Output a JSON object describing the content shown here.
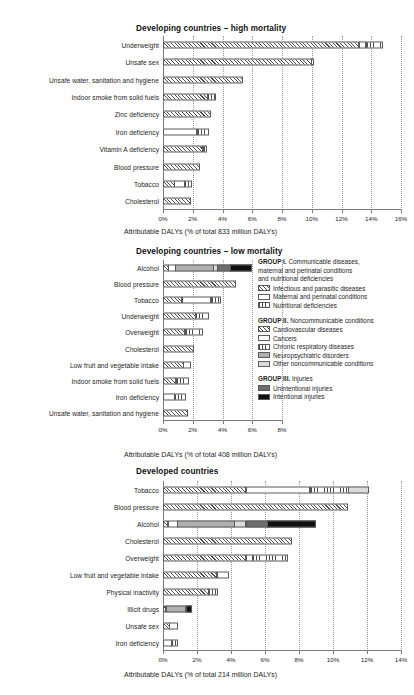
{
  "chart_data": [
    {
      "type": "bar",
      "orientation": "horizontal",
      "stacked": true,
      "title": "Developing countries – high mortality",
      "xlabel": "Attributable DALYs (% of total 833 million DALYs)",
      "ylabel": "",
      "xlim": [
        0,
        16
      ],
      "xticks": [
        "0%",
        "2%",
        "4%",
        "6%",
        "8%",
        "10%",
        "12%",
        "14%",
        "16%"
      ],
      "xtick_values": [
        0,
        2,
        4,
        6,
        8,
        10,
        12,
        14,
        16
      ],
      "grid": "vertical-dotted",
      "categories": [
        "Underweight",
        "Unsafe sex",
        "Unsafe water, sanitation and hygiene",
        "Indoor smoke from solid fuels",
        "Zinc deficiency",
        "Iron deficiency",
        "Vitamin A deficiency",
        "Blood pressure",
        "Tobacco",
        "Cholesterol"
      ],
      "segment_names": [
        "Infectious and parasitic diseases",
        "Maternal and perinatal conditions",
        "Nutritional deficiencies",
        "Cardiovascular diseases",
        "Cancers",
        "Chronic respiratory diseases",
        "Neuropsychiatric disorders",
        "Other noncommunicable conditions",
        "Unintentional injuries",
        "Intentional injuries"
      ],
      "bars": [
        {
          "category": "Underweight",
          "total": 14.9,
          "segments": [
            {
              "fill": "infectious-and-parasitic-diseases",
              "value": 13.2
            },
            {
              "fill": "maternal-and-perinatal-conditions",
              "value": 0.5
            },
            {
              "fill": "nutritional-deficiencies",
              "value": 1.2
            }
          ]
        },
        {
          "category": "Unsafe sex",
          "total": 10.2,
          "segments": [
            {
              "fill": "infectious-and-parasitic-diseases",
              "value": 10.0
            },
            {
              "fill": "cancers",
              "value": 0.2
            }
          ]
        },
        {
          "category": "Unsafe water, sanitation and hygiene",
          "total": 5.4,
          "segments": [
            {
              "fill": "infectious-and-parasitic-diseases",
              "value": 5.4
            }
          ]
        },
        {
          "category": "Indoor smoke from solid fuels",
          "total": 3.6,
          "segments": [
            {
              "fill": "infectious-and-parasitic-diseases",
              "value": 3.0
            },
            {
              "fill": "chronic-respiratory-diseases",
              "value": 0.6
            }
          ]
        },
        {
          "category": "Zinc deficiency",
          "total": 3.2,
          "segments": [
            {
              "fill": "infectious-and-parasitic-diseases",
              "value": 3.2
            }
          ]
        },
        {
          "category": "Iron deficiency",
          "total": 3.1,
          "segments": [
            {
              "fill": "maternal-and-perinatal-conditions",
              "value": 2.3
            },
            {
              "fill": "nutritional-deficiencies",
              "value": 0.8
            }
          ]
        },
        {
          "category": "Vitamin A deficiency",
          "total": 3.0,
          "segments": [
            {
              "fill": "infectious-and-parasitic-diseases",
              "value": 2.7
            },
            {
              "fill": "nutritional-deficiencies",
              "value": 0.3
            }
          ]
        },
        {
          "category": "Blood pressure",
          "total": 2.5,
          "segments": [
            {
              "fill": "cardiovascular-diseases",
              "value": 2.5
            }
          ]
        },
        {
          "category": "Tobacco",
          "total": 2.0,
          "segments": [
            {
              "fill": "cardiovascular-diseases",
              "value": 0.8
            },
            {
              "fill": "cancers",
              "value": 0.7
            },
            {
              "fill": "chronic-respiratory-diseases",
              "value": 0.5
            }
          ]
        },
        {
          "category": "Cholesterol",
          "total": 1.9,
          "segments": [
            {
              "fill": "cardiovascular-diseases",
              "value": 1.9
            }
          ]
        }
      ]
    },
    {
      "type": "bar",
      "orientation": "horizontal",
      "stacked": true,
      "title": "Developing countries – low mortality",
      "xlabel": "Attributable DALYs (% of total 408 million DALYs)",
      "ylabel": "",
      "xlim": [
        0,
        8
      ],
      "xticks": [
        "0%",
        "2%",
        "4%",
        "6%",
        "8%"
      ],
      "xtick_values": [
        0,
        2,
        4,
        6,
        8
      ],
      "grid": "vertical-dotted",
      "categories": [
        "Alcohol",
        "Blood pressure",
        "Tobacco",
        "Underweight",
        "Overweight",
        "Cholesterol",
        "Low fruit and vegetable intake",
        "Indoor smoke from solid fuels",
        "Iron deficiency",
        "Unsafe water, sanitation and hygiene"
      ],
      "bars": [
        {
          "category": "Alcohol",
          "total": 6.2,
          "segments": [
            {
              "fill": "infectious-and-parasitic-diseases",
              "value": 0.4
            },
            {
              "fill": "cancers",
              "value": 0.5
            },
            {
              "fill": "neuropsychiatric-disorders",
              "value": 2.6
            },
            {
              "fill": "other-noncommunicable-conditions",
              "value": 0.3
            },
            {
              "fill": "unintentional-injuries",
              "value": 0.9
            },
            {
              "fill": "intentional-injuries",
              "value": 1.5
            }
          ]
        },
        {
          "category": "Blood pressure",
          "total": 4.9,
          "segments": [
            {
              "fill": "cardiovascular-diseases",
              "value": 4.9
            }
          ]
        },
        {
          "category": "Tobacco",
          "total": 4.0,
          "segments": [
            {
              "fill": "cardiovascular-diseases",
              "value": 1.3
            },
            {
              "fill": "cancers",
              "value": 2.0
            },
            {
              "fill": "chronic-respiratory-diseases",
              "value": 0.7
            }
          ]
        },
        {
          "category": "Underweight",
          "total": 3.1,
          "segments": [
            {
              "fill": "infectious-and-parasitic-diseases",
              "value": 2.2
            },
            {
              "fill": "nutritional-deficiencies",
              "value": 0.9
            }
          ]
        },
        {
          "category": "Overweight",
          "total": 2.7,
          "segments": [
            {
              "fill": "cardiovascular-diseases",
              "value": 1.5
            },
            {
              "fill": "chronic-respiratory-diseases",
              "value": 1.2
            }
          ]
        },
        {
          "category": "Cholesterol",
          "total": 2.1,
          "segments": [
            {
              "fill": "cardiovascular-diseases",
              "value": 2.1
            }
          ]
        },
        {
          "category": "Low fruit and vegetable intake",
          "total": 1.9,
          "segments": [
            {
              "fill": "cardiovascular-diseases",
              "value": 1.4
            },
            {
              "fill": "cancers",
              "value": 0.5
            }
          ]
        },
        {
          "category": "Indoor smoke from solid fuels",
          "total": 1.8,
          "segments": [
            {
              "fill": "infectious-and-parasitic-diseases",
              "value": 0.9
            },
            {
              "fill": "chronic-respiratory-diseases",
              "value": 0.9
            }
          ]
        },
        {
          "category": "Iron deficiency",
          "total": 1.6,
          "segments": [
            {
              "fill": "maternal-and-perinatal-conditions",
              "value": 0.8
            },
            {
              "fill": "nutritional-deficiencies",
              "value": 0.8
            }
          ]
        },
        {
          "category": "Unsafe water, sanitation and hygiene",
          "total": 1.7,
          "segments": [
            {
              "fill": "infectious-and-parasitic-diseases",
              "value": 1.7
            }
          ]
        }
      ]
    },
    {
      "type": "bar",
      "orientation": "horizontal",
      "stacked": true,
      "title": "Developed countries",
      "xlabel": "Attributable DALYs (% of total 214 million DALYs)",
      "ylabel": "",
      "xlim": [
        0,
        14
      ],
      "xticks": [
        "0%",
        "2%",
        "4%",
        "6%",
        "8%",
        "10%",
        "12%",
        "14%"
      ],
      "xtick_values": [
        0,
        2,
        4,
        6,
        8,
        10,
        12,
        14
      ],
      "grid": "vertical-dotted",
      "categories": [
        "Tobacco",
        "Blood pressure",
        "Alcohol",
        "Cholesterol",
        "Overweight",
        "Low fruit and vegetable intake",
        "Physical inactivity",
        "Illicit drugs",
        "Unsafe sex",
        "Iron deficiency"
      ],
      "bars": [
        {
          "category": "Tobacco",
          "total": 12.2,
          "segments": [
            {
              "fill": "cardiovascular-diseases",
              "value": 4.9
            },
            {
              "fill": "cancers",
              "value": 3.8
            },
            {
              "fill": "chronic-respiratory-diseases",
              "value": 2.3
            },
            {
              "fill": "other-noncommunicable-conditions",
              "value": 1.2
            }
          ]
        },
        {
          "category": "Blood pressure",
          "total": 10.9,
          "segments": [
            {
              "fill": "cardiovascular-diseases",
              "value": 10.9
            }
          ]
        },
        {
          "category": "Alcohol",
          "total": 9.2,
          "segments": [
            {
              "fill": "cardiovascular-diseases",
              "value": 0.3
            },
            {
              "fill": "cancers",
              "value": 0.6
            },
            {
              "fill": "neuropsychiatric-disorders",
              "value": 3.4
            },
            {
              "fill": "other-noncommunicable-conditions",
              "value": 0.7
            },
            {
              "fill": "unintentional-injuries",
              "value": 1.3
            },
            {
              "fill": "intentional-injuries",
              "value": 2.9
            }
          ]
        },
        {
          "category": "Cholesterol",
          "total": 7.6,
          "segments": [
            {
              "fill": "cardiovascular-diseases",
              "value": 7.6
            }
          ]
        },
        {
          "category": "Overweight",
          "total": 7.4,
          "segments": [
            {
              "fill": "cardiovascular-diseases",
              "value": 4.9
            },
            {
              "fill": "cancers",
              "value": 0.4
            },
            {
              "fill": "chronic-respiratory-diseases",
              "value": 2.1
            }
          ]
        },
        {
          "category": "Low fruit and vegetable intake",
          "total": 3.9,
          "segments": [
            {
              "fill": "cardiovascular-diseases",
              "value": 3.2
            },
            {
              "fill": "cancers",
              "value": 0.7
            }
          ]
        },
        {
          "category": "Physical inactivity",
          "total": 3.3,
          "segments": [
            {
              "fill": "cardiovascular-diseases",
              "value": 2.7
            },
            {
              "fill": "chronic-respiratory-diseases",
              "value": 0.6
            }
          ]
        },
        {
          "category": "Illicit drugs",
          "total": 1.8,
          "segments": [
            {
              "fill": "cardiovascular-diseases",
              "value": 0.2
            },
            {
              "fill": "neuropsychiatric-disorders",
              "value": 1.2
            },
            {
              "fill": "intentional-injuries",
              "value": 0.4
            }
          ]
        },
        {
          "category": "Unsafe sex",
          "total": 0.9,
          "segments": [
            {
              "fill": "cardiovascular-diseases",
              "value": 0.4
            },
            {
              "fill": "cancers",
              "value": 0.5
            }
          ]
        },
        {
          "category": "Iron deficiency",
          "total": 0.9,
          "segments": [
            {
              "fill": "maternal-and-perinatal-conditions",
              "value": 0.5
            },
            {
              "fill": "nutritional-deficiencies",
              "value": 0.4
            }
          ]
        }
      ]
    }
  ],
  "legend": {
    "groups": [
      {
        "heading_bold": "GROUP I.",
        "heading_rest": " Communicable diseases,",
        "heading_lines": [
          "maternal and perinatal conditions",
          "and nutritional deficiencies"
        ],
        "items": [
          {
            "label": "Infectious and parasitic diseases",
            "fill": "f-infect"
          },
          {
            "label": "Maternal and perinatal conditions",
            "fill": "f-maternal"
          },
          {
            "label": "Nutritional deficiencies",
            "fill": "f-nutri"
          }
        ]
      },
      {
        "heading_bold": "GROUP II.",
        "heading_rest": " Noncommunicable conditions",
        "heading_lines": [],
        "items": [
          {
            "label": "Cardiovascular diseases",
            "fill": "f-cardio"
          },
          {
            "label": "Cancers",
            "fill": "f-cancer"
          },
          {
            "label": "Chronic respiratory diseases",
            "fill": "f-resp"
          },
          {
            "label": "Neuropsychiatric disorders",
            "fill": "f-neuro"
          },
          {
            "label": "Other noncommunicable conditions",
            "fill": "f-other"
          }
        ]
      },
      {
        "heading_bold": "GROUP III.",
        "heading_rest": " Injuries",
        "heading_lines": [],
        "items": [
          {
            "label": "Unintentional injuries",
            "fill": "f-unint"
          },
          {
            "label": "Intentional injuries",
            "fill": "f-int"
          }
        ]
      }
    ]
  },
  "footnote": ""
}
